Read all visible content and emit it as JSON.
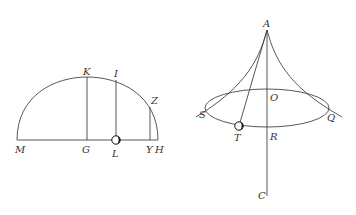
{
  "figure_left": {
    "title": "Semicircle with ordinates",
    "labels": {
      "M": "M",
      "G": "G",
      "L": "L",
      "Y": "Y",
      "H": "H",
      "K": "K",
      "I": "I",
      "Z": "Z"
    },
    "points": {
      "M": [
        17,
        140
      ],
      "H": [
        158,
        140
      ],
      "G": [
        87,
        140
      ],
      "K": [
        87,
        77
      ],
      "L": [
        116,
        140
      ],
      "I": [
        116,
        80
      ],
      "Y": [
        150,
        140
      ],
      "Z": [
        150,
        107
      ]
    }
  },
  "figure_right": {
    "title": "Conical pendulum",
    "labels": {
      "A": "A",
      "O": "O",
      "S": "S",
      "Q": "Q",
      "T": "T",
      "R": "R",
      "C": "C"
    },
    "points": {
      "A": [
        267,
        30
      ],
      "O": [
        267,
        90
      ],
      "R": [
        267,
        127
      ],
      "C": [
        267,
        196
      ],
      "S": [
        206,
        108
      ],
      "Q": [
        329,
        108
      ],
      "T": [
        239,
        126
      ]
    },
    "ellipse": {
      "cx": 267,
      "cy": 108,
      "rx": 62,
      "ry": 19
    }
  },
  "colors": {
    "line": "#444444",
    "text": "#333333",
    "ball": "#111111"
  }
}
